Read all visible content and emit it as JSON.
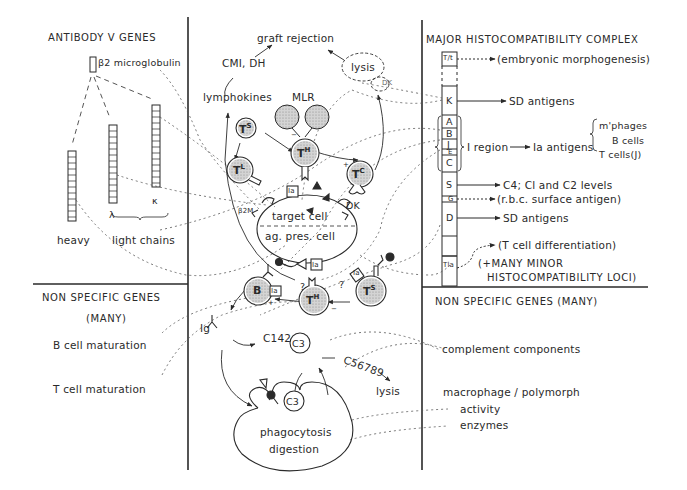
{
  "colors": {
    "ink": "#2a2a2a",
    "background": "#ffffff",
    "cell_fill": "#c8c8c8",
    "dotted": "#555555"
  },
  "panels": {
    "antibody": {
      "title": "ANTIBODY V GENES",
      "beta2": "β2 microglobulin",
      "lambda": "λ",
      "kappa": "κ",
      "heavy": "heavy",
      "light_chains": "light chains"
    },
    "nonspecific_left": {
      "title": "NON SPECIFIC GENES",
      "subtitle": "(MANY)",
      "items": [
        "B cell maturation",
        "T cell maturation"
      ]
    },
    "mhc": {
      "title": "MAJOR HISTOCOMPATIBILITY COMPLEX",
      "loci": [
        {
          "label": "T/t",
          "product": "(embryonic morphogenesis)"
        },
        {
          "label": "K",
          "product": "SD antigens"
        },
        {
          "label": "A",
          "product": ""
        },
        {
          "label": "B",
          "product": ""
        },
        {
          "label": "J",
          "product": ""
        },
        {
          "label": "E",
          "product": ""
        },
        {
          "label": "C",
          "product": ""
        },
        {
          "label": "S",
          "product": "C4; Cl and C2 levels"
        },
        {
          "label": "G",
          "product": "(r.b.c. surface antigen)"
        },
        {
          "label": "D",
          "product": "SD antigens"
        },
        {
          "label": "Tla",
          "product": "(T cell differentiation)"
        }
      ],
      "i_region": "I region",
      "ia_antigens": "Ia antigens",
      "ia_targets": [
        "m'phages",
        "B cells",
        "T cells(J)"
      ],
      "minor_loci_line1": "(+MANY MINOR",
      "minor_loci_line2": "HISTOCOMPATIBILITY LOCI)"
    },
    "nonspecific_right": {
      "title": "NON SPECIFIC GENES (MANY)",
      "complement": "complement components",
      "macrophage": "macrophage / polymorph",
      "activity": "activity",
      "enzymes": "enzymes"
    }
  },
  "center": {
    "graft_rejection": "graft rejection",
    "cmi_dh": "CMI, DH",
    "lymphokines": "lymphokines",
    "mlr": "MLR",
    "lysis_top": "lysis",
    "dk_top": "DK",
    "ts": "T",
    "ts_sup": "S",
    "tl": "T",
    "tl_sup": "L",
    "th": "T",
    "th_sup": "H",
    "tc": "T",
    "tc_sup": "C",
    "ia": "Ia",
    "b2m": "β2M",
    "dk": "DK",
    "target_cell": "target cell",
    "ag_pres_cell": "ag. pres. cell",
    "b": "B",
    "q": "?",
    "plus": "+",
    "minus": "−",
    "ig": "Ig",
    "c142": "C142",
    "c3": "C3",
    "c56789": "C56789",
    "lysis_bottom": "lysis",
    "phagocytosis": "phagocytosis",
    "digestion": "digestion"
  }
}
